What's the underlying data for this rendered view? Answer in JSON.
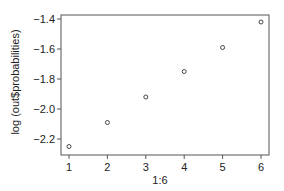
{
  "chart_data": {
    "type": "scatter",
    "title": "",
    "xlabel": "1:6",
    "ylabel": "log (out$probabilities)",
    "x": [
      1,
      2,
      3,
      4,
      5,
      6
    ],
    "series": [
      {
        "name": "log(out$probabilities)",
        "values": [
          -2.25,
          -2.09,
          -1.92,
          -1.75,
          -1.59,
          -1.42
        ],
        "marker": "open-circle"
      }
    ],
    "xlim": [
      0.8,
      6.2
    ],
    "ylim": [
      -2.31,
      -1.37
    ],
    "xticks": [
      1,
      2,
      3,
      4,
      5,
      6
    ],
    "xtick_labels": [
      "1",
      "2",
      "3",
      "4",
      "5",
      "6"
    ],
    "yticks": [
      -2.2,
      -2.0,
      -1.8,
      -1.6,
      -1.4
    ],
    "ytick_labels": [
      "-2.2",
      "-2.0",
      "-1.8",
      "-1.6",
      "-1.4"
    ],
    "grid": false,
    "legend": null
  },
  "style": {
    "axis_color": "#555555",
    "point_color": "#333333",
    "text_color": "#222222"
  }
}
